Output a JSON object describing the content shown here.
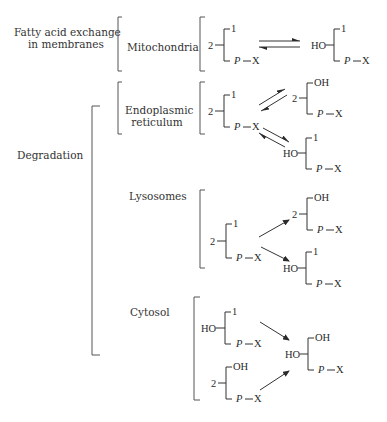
{
  "sections": {
    "exchange": {
      "title_line1": "Fatty acid exchange",
      "title_line2": "in membranes"
    },
    "degradation": {
      "title": "Degradation"
    }
  },
  "organelles": {
    "mitochondria": "Mitochondria",
    "er_line1": "Endoplasmic",
    "er_line2": "reticulum",
    "lysosomes": "Lysosomes",
    "cytosol": "Cytosol"
  },
  "glyph": {
    "one": "1",
    "two": "2",
    "oh": "OH",
    "ho": "HO",
    "p": "P",
    "x": "X",
    "dash": "—"
  },
  "diagram": {
    "nodes": [
      {
        "id": "mito_diacyl",
        "group": "Mitochondria",
        "pos1": "1",
        "pos2": "2",
        "pos3": "P—X"
      },
      {
        "id": "mito_lyso1",
        "group": "Mitochondria",
        "pos1": "1",
        "pos2": "HO",
        "pos3": "P—X"
      },
      {
        "id": "er_diacyl",
        "group": "Endoplasmic reticulum",
        "pos1": "1",
        "pos2": "2",
        "pos3": "P—X"
      },
      {
        "id": "er_lyso2",
        "group": "Endoplasmic reticulum",
        "pos1": "OH",
        "pos2": "2",
        "pos3": "P—X"
      },
      {
        "id": "er_lyso1",
        "group": "Endoplasmic reticulum",
        "pos1": "1",
        "pos2": "HO",
        "pos3": "P—X"
      },
      {
        "id": "lys_diacyl",
        "group": "Lysosomes",
        "pos1": "1",
        "pos2": "2",
        "pos3": "P—X"
      },
      {
        "id": "lys_lyso2",
        "group": "Lysosomes",
        "pos1": "OH",
        "pos2": "2",
        "pos3": "P—X"
      },
      {
        "id": "lys_lyso1",
        "group": "Lysosomes",
        "pos1": "1",
        "pos2": "HO",
        "pos3": "P—X"
      },
      {
        "id": "cyt_lyso1",
        "group": "Cytosol",
        "pos1": "1",
        "pos2": "HO",
        "pos3": "P—X"
      },
      {
        "id": "cyt_lyso2",
        "group": "Cytosol",
        "pos1": "OH",
        "pos2": "2",
        "pos3": "P—X"
      },
      {
        "id": "cyt_gpx",
        "group": "Cytosol",
        "pos1": "OH",
        "pos2": "HO",
        "pos3": "P—X"
      }
    ],
    "edges": [
      {
        "from": "mito_diacyl",
        "to": "mito_lyso1",
        "type": "reversible"
      },
      {
        "from": "er_diacyl",
        "to": "er_lyso2",
        "type": "reversible"
      },
      {
        "from": "er_diacyl",
        "to": "er_lyso1",
        "type": "reversible"
      },
      {
        "from": "lys_diacyl",
        "to": "lys_lyso2",
        "type": "forward"
      },
      {
        "from": "lys_diacyl",
        "to": "lys_lyso1",
        "type": "forward"
      },
      {
        "from": "cyt_lyso1",
        "to": "cyt_gpx",
        "type": "forward"
      },
      {
        "from": "cyt_lyso2",
        "to": "cyt_gpx",
        "type": "forward"
      }
    ]
  }
}
